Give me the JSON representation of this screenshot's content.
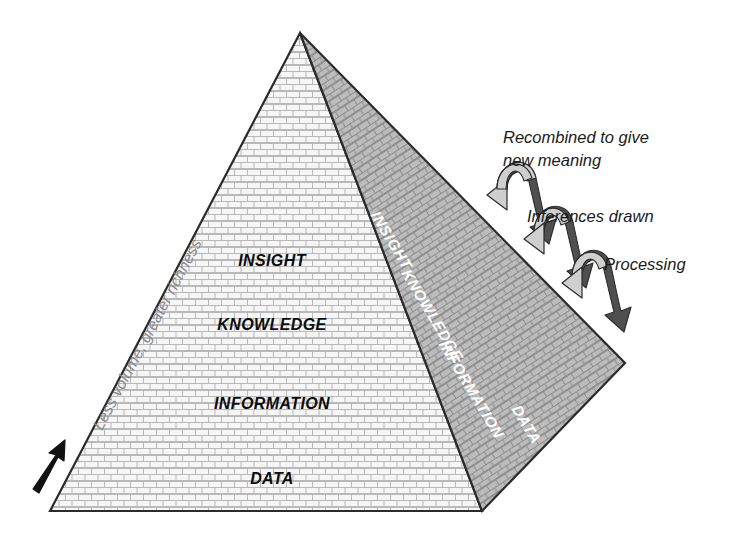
{
  "diagram": {
    "front_face": {
      "name": "front-face",
      "fill_color": "#f7f7f7",
      "levels": [
        {
          "label": "INSIGHT",
          "x": 272,
          "y": 266
        },
        {
          "label": "KNOWLEDGE",
          "x": 272,
          "y": 330
        },
        {
          "label": "INFORMATION",
          "x": 272,
          "y": 409
        },
        {
          "label": "DATA",
          "x": 272,
          "y": 484
        }
      ]
    },
    "right_face": {
      "name": "right-face",
      "fill_color": "#bdbdbd",
      "levels": [
        {
          "label": "INSIGHT",
          "x": 387,
          "y": 243
        },
        {
          "label": "KNOWLEDGE",
          "x": 428,
          "y": 318
        },
        {
          "label": "INFORMATION",
          "x": 467,
          "y": 392
        },
        {
          "label": "DATA",
          "x": 518,
          "y": 424
        }
      ]
    },
    "left_axis_label": "Less volume, greater richness",
    "left_axis_color": "#8a8a8a",
    "annotations": [
      {
        "id": "recombined",
        "lines": [
          "Recombined to give",
          "new meaning"
        ],
        "x": 503,
        "y": 143
      },
      {
        "id": "inferences",
        "lines": [
          "Inferences drawn"
        ],
        "x": 527,
        "y": 216
      },
      {
        "id": "processing",
        "lines": [
          "Processing"
        ],
        "x": 604,
        "y": 265
      }
    ],
    "arrows": {
      "curved_arrow_color": "#c9c9c9",
      "curved_arrow_shadow": "#5a5a5a",
      "straight_arrow_color": "#111111",
      "count": 3
    },
    "outline_color": "#2b2b2b",
    "background": "#ffffff"
  }
}
